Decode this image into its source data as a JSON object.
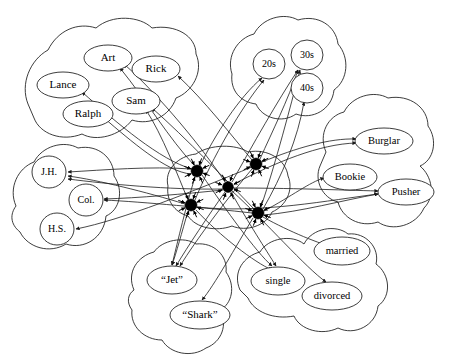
{
  "figure": {
    "background_color": "#ffffff",
    "line_color": "#1a1a1a",
    "hub_color": "#000000",
    "width": 452,
    "height": 361
  },
  "pools": [
    {
      "id": "names",
      "label": "Name pool",
      "units": [
        {
          "id": "art",
          "label": "Art",
          "cx": 108,
          "cy": 58,
          "rx": 24,
          "ry": 13,
          "shape": "ellipse",
          "font_size": 11
        },
        {
          "id": "rick",
          "label": "Rick",
          "cx": 156,
          "cy": 69,
          "rx": 24,
          "ry": 13,
          "shape": "ellipse",
          "font_size": 11
        },
        {
          "id": "lance",
          "label": "Lance",
          "cx": 63,
          "cy": 85,
          "rx": 26,
          "ry": 13,
          "shape": "ellipse",
          "font_size": 11
        },
        {
          "id": "sam",
          "label": "Sam",
          "cx": 136,
          "cy": 101,
          "rx": 24,
          "ry": 13,
          "shape": "ellipse",
          "font_size": 11
        },
        {
          "id": "ralph",
          "label": "Ralph",
          "cx": 88,
          "cy": 114,
          "rx": 25,
          "ry": 13,
          "shape": "ellipse",
          "font_size": 11
        }
      ]
    },
    {
      "id": "ages",
      "label": "Age pool",
      "units": [
        {
          "id": "20s",
          "label": "20s",
          "cx": 269,
          "cy": 64,
          "rx": 16,
          "ry": 15,
          "shape": "ellipse",
          "font_size": 10
        },
        {
          "id": "30s",
          "label": "30s",
          "cx": 307,
          "cy": 55,
          "rx": 16,
          "ry": 15,
          "shape": "ellipse",
          "font_size": 10
        },
        {
          "id": "40s",
          "label": "40s",
          "cx": 307,
          "cy": 88,
          "rx": 16,
          "ry": 15,
          "shape": "ellipse",
          "font_size": 10
        }
      ]
    },
    {
      "id": "occupations",
      "label": "Occupation pool",
      "units": [
        {
          "id": "burglar",
          "label": "Burglar",
          "cx": 384,
          "cy": 141,
          "rx": 29,
          "ry": 13,
          "shape": "ellipse",
          "font_size": 10.5
        },
        {
          "id": "bookie",
          "label": "Bookie",
          "cx": 350,
          "cy": 177,
          "rx": 27,
          "ry": 13,
          "shape": "ellipse",
          "font_size": 10.5
        },
        {
          "id": "pusher",
          "label": "Pusher",
          "cx": 406,
          "cy": 192,
          "rx": 28,
          "ry": 13,
          "shape": "ellipse",
          "font_size": 10.5
        }
      ]
    },
    {
      "id": "education",
      "label": "Education pool",
      "units": [
        {
          "id": "jh",
          "label": "J.H.",
          "cx": 49,
          "cy": 172,
          "rx": 17,
          "ry": 16,
          "shape": "ellipse",
          "font_size": 10
        },
        {
          "id": "col",
          "label": "Col.",
          "cx": 86,
          "cy": 200,
          "rx": 17,
          "ry": 16,
          "shape": "ellipse",
          "font_size": 10
        },
        {
          "id": "hs",
          "label": "H.S.",
          "cx": 57,
          "cy": 229,
          "rx": 17,
          "ry": 16,
          "shape": "ellipse",
          "font_size": 10
        }
      ]
    },
    {
      "id": "gangs",
      "label": "Gang pool",
      "units": [
        {
          "id": "jet",
          "label": "“Jet”",
          "cx": 172,
          "cy": 280,
          "rx": 25,
          "ry": 14,
          "shape": "ellipse",
          "font_size": 11
        },
        {
          "id": "shark",
          "label": "“Shark”",
          "cx": 200,
          "cy": 315,
          "rx": 30,
          "ry": 14,
          "shape": "ellipse",
          "font_size": 11
        }
      ]
    },
    {
      "id": "marital",
      "label": "Marital status pool",
      "units": [
        {
          "id": "single",
          "label": "single",
          "cx": 278,
          "cy": 281,
          "rx": 27,
          "ry": 14,
          "shape": "ellipse",
          "font_size": 10.5
        },
        {
          "id": "married",
          "label": "married",
          "cx": 342,
          "cy": 251,
          "rx": 28,
          "ry": 14,
          "shape": "ellipse",
          "font_size": 10.5
        },
        {
          "id": "divorced",
          "label": "divorced",
          "cx": 332,
          "cy": 296,
          "rx": 30,
          "ry": 14,
          "shape": "ellipse",
          "font_size": 10.5
        }
      ]
    },
    {
      "id": "instances",
      "label": "Instance pool",
      "units": [
        {
          "id": "inst1",
          "label": "",
          "cx": 197,
          "cy": 171,
          "r": 6.0,
          "shape": "hub"
        },
        {
          "id": "inst2",
          "label": "",
          "cx": 256,
          "cy": 164,
          "r": 6.0,
          "shape": "hub"
        },
        {
          "id": "inst3",
          "label": "",
          "cx": 228,
          "cy": 187,
          "r": 5.4,
          "shape": "hub"
        },
        {
          "id": "inst4",
          "label": "",
          "cx": 191,
          "cy": 205,
          "r": 6.0,
          "shape": "hub"
        },
        {
          "id": "inst5",
          "label": "",
          "cx": 258,
          "cy": 213,
          "r": 6.0,
          "shape": "hub"
        }
      ]
    }
  ],
  "pool_outlines": {
    "names": "M 28 104 C 20 84 30 60 48 50 C 58 30 78 22 96 28 C 112 14 140 16 152 28 C 176 24 196 36 196 54 C 204 72 192 92 176 98 C 170 116 150 126 132 120 C 120 136 96 142 82 134 C 62 142 40 134 34 118 Z",
    "ages": "M 232 74 C 226 56 238 38 254 34 C 262 18 284 12 298 20 C 318 14 336 26 338 44 C 350 58 348 80 334 90 C 332 110 312 120 296 114 C 282 124 262 118 256 104 C 240 102 230 90 232 74 Z",
    "occupations": "M 326 152 C 318 134 328 116 344 112 C 352 96 374 90 388 98 C 410 94 428 108 428 126 C 438 140 434 160 420 166 C 432 176 436 196 424 208 C 416 226 392 232 378 222 C 360 228 342 218 338 202 C 322 198 314 180 320 166 Z",
    "education": "M 16 206 C 8 188 18 168 34 162 C 42 146 64 140 78 148 C 98 144 114 158 114 176 C 124 190 120 210 106 216 C 104 238 84 250 66 244 C 50 254 28 248 20 232 C 10 224 10 214 16 206 Z",
    "gangs": "M 134 290 C 126 272 138 256 154 252 C 162 240 184 236 196 244 C 214 242 228 256 226 272 C 236 286 232 304 220 310 C 228 324 222 342 206 348 C 192 358 170 354 162 340 C 144 340 130 326 132 310 C 126 302 128 294 134 290 Z",
    "marital": "M 240 290 C 232 272 244 256 260 252 C 268 238 292 234 304 244 C 312 228 336 224 348 234 C 366 232 380 248 376 264 C 390 274 392 296 378 306 C 376 326 354 336 338 328 C 322 336 300 330 294 316 C 274 320 254 312 248 298 Z",
    "instances": "M 168 186 C 164 170 178 156 196 154 C 210 144 236 144 248 152 C 268 148 286 160 288 176 C 294 190 286 206 272 212 C 266 226 246 232 232 226 C 216 232 196 228 188 216 C 174 212 166 200 168 186 Z"
  },
  "edges": [
    {
      "from": "inst1",
      "to": "art",
      "d": "M 194 165 C 170 140 146 100 120 68"
    },
    {
      "from": "inst1",
      "to": "lance",
      "d": "M 192 169 C 160 160 118 124 82 92"
    },
    {
      "from": "inst1",
      "to": "ralph",
      "d": "M 191 174 C 166 172 130 140 104 118"
    },
    {
      "from": "inst4",
      "to": "sam",
      "d": "M 188 200 C 178 176 162 134 146 110"
    },
    {
      "from": "inst2",
      "to": "rick",
      "d": "M 252 160 C 232 136 204 100 178 76"
    },
    {
      "from": "inst3",
      "to": "art",
      "d": "M 225 182 C 204 150 160 96 124 64"
    },
    {
      "from": "inst5",
      "to": "sam",
      "d": "M 254 209 C 228 182 186 138 152 108"
    },
    {
      "from": "inst1",
      "to": "20s",
      "d": "M 200 166 C 214 136 240 96 262 78"
    },
    {
      "from": "inst4",
      "to": "20s",
      "d": "M 195 200 C 212 158 242 106 264 80"
    },
    {
      "from": "inst3",
      "to": "30s",
      "d": "M 232 182 C 252 146 278 100 298 70"
    },
    {
      "from": "inst5",
      "to": "30s",
      "d": "M 261 207 C 276 162 290 108 300 70"
    },
    {
      "from": "inst2",
      "to": "30s",
      "d": "M 260 159 C 272 132 288 100 298 70"
    },
    {
      "from": "inst5",
      "to": "40s",
      "d": "M 263 209 C 282 176 298 138 304 102"
    },
    {
      "from": "inst2",
      "to": "burglar",
      "d": "M 262 162 C 296 148 330 138 356 139"
    },
    {
      "from": "inst3",
      "to": "burglar",
      "d": "M 234 184 C 276 162 320 144 356 143"
    },
    {
      "from": "inst5",
      "to": "bookie",
      "d": "M 264 211 C 292 196 310 182 324 178"
    },
    {
      "from": "inst3",
      "to": "pusher",
      "d": "M 234 188 C 288 188 340 190 378 191"
    },
    {
      "from": "inst4",
      "to": "pusher",
      "d": "M 197 207 C 260 214 330 200 378 194"
    },
    {
      "from": "inst5",
      "to": "pusher",
      "d": "M 264 215 C 300 212 344 200 378 194"
    },
    {
      "from": "inst1",
      "to": "jh",
      "d": "M 191 169 C 150 166 104 170 68 172"
    },
    {
      "from": "inst4",
      "to": "jh",
      "d": "M 185 204 C 146 192 98 180 68 176"
    },
    {
      "from": "inst3",
      "to": "jh",
      "d": "M 223 189 C 168 190 108 184 68 179"
    },
    {
      "from": "inst5",
      "to": "col",
      "d": "M 252 213 C 208 208 144 202 104 200"
    },
    {
      "from": "inst3",
      "to": "col",
      "d": "M 223 190 C 184 194 138 198 104 199"
    },
    {
      "from": "inst2",
      "to": "hs",
      "d": "M 252 167 C 196 190 122 220 76 229"
    },
    {
      "from": "inst4",
      "to": "jet",
      "d": "M 188 211 C 182 232 176 254 172 265"
    },
    {
      "from": "inst1",
      "to": "jet",
      "d": "M 195 177 C 186 206 178 240 172 265"
    },
    {
      "from": "inst3",
      "to": "jet",
      "d": "M 225 192 C 208 216 188 246 176 266"
    },
    {
      "from": "inst2",
      "to": "jet",
      "d": "M 252 169 C 226 200 196 240 180 266"
    },
    {
      "from": "inst5",
      "to": "shark",
      "d": "M 253 218 C 236 246 214 286 202 300"
    },
    {
      "from": "inst1",
      "to": "single",
      "d": "M 202 175 C 226 210 256 252 272 266"
    },
    {
      "from": "inst4",
      "to": "single",
      "d": "M 196 210 C 220 236 254 262 272 270"
    },
    {
      "from": "inst3",
      "to": "single",
      "d": "M 231 192 C 248 222 266 250 276 266"
    },
    {
      "from": "inst5",
      "to": "married",
      "d": "M 263 217 C 290 232 320 244 336 248"
    },
    {
      "from": "inst3",
      "to": "divorced",
      "d": "M 232 191 C 266 222 306 268 326 282"
    }
  ],
  "hub_spokes": {
    "count": 8,
    "inner": 6.5,
    "outer": 13.5
  }
}
